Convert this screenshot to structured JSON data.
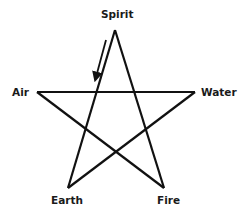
{
  "diagram": {
    "type": "pentagram",
    "stroke_color": "#111111",
    "background": "#ffffff",
    "points": {
      "spirit": {
        "label": "Spirit",
        "x": 115,
        "y": 30
      },
      "water": {
        "label": "Water",
        "x": 195,
        "y": 92
      },
      "fire": {
        "label": "Fire",
        "x": 164,
        "y": 188
      },
      "earth": {
        "label": "Earth",
        "x": 68,
        "y": 188
      },
      "air": {
        "label": "Air",
        "x": 37,
        "y": 92
      }
    },
    "star_path_order": [
      "spirit",
      "fire",
      "air",
      "water",
      "earth",
      "spirit"
    ],
    "arrow": {
      "description": "Direction arrow beside Spirit-to-Earth stroke, pointing down-left",
      "from": {
        "x": 106,
        "y": 40
      },
      "to": {
        "x": 96,
        "y": 77
      }
    }
  },
  "labels": {
    "spirit": "Spirit",
    "air": "Air",
    "water": "Water",
    "earth": "Earth",
    "fire": "Fire"
  }
}
